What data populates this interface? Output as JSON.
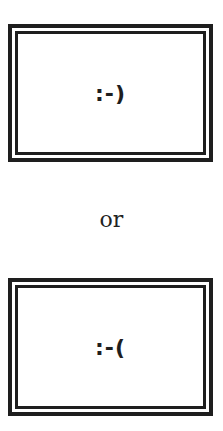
{
  "panels": [
    {
      "id": "happy",
      "text": ":-)"
    },
    {
      "id": "sad",
      "text": ":-("
    }
  ],
  "separator": "or"
}
